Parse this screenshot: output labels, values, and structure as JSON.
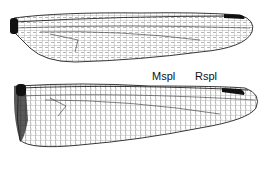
{
  "figure": {
    "type": "dragonfly wing venation",
    "wings": [
      {
        "name": "forewing",
        "position": "top"
      },
      {
        "name": "hindwing",
        "position": "bottom"
      }
    ],
    "labels": {
      "mspl": "Mspl",
      "rspl": "Rspl"
    },
    "colors": {
      "vein": "#222222",
      "pterostigma": "#111111",
      "background": "#ffffff"
    }
  }
}
